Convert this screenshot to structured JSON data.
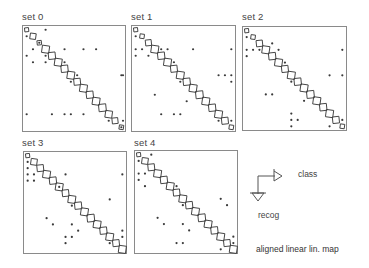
{
  "figure": {
    "caption": "aligned linear lin. map",
    "legend": {
      "x_axis_label": "class",
      "y_axis_label": "recog"
    }
  },
  "chart_data": {
    "type": "heatmap",
    "title": "aligned linear lin. map",
    "xlabel": "class",
    "ylabel": "recog",
    "grid_size": 16,
    "note": "confusion matrices; diagonal entries drawn as squares (size ~ count), off-diagonal errors drawn as dots; positions are [row, col] class indices",
    "panels": [
      {
        "label": "set 0",
        "diagonal_relative_size": [
          0.55,
          0.8,
          0.6,
          1.0,
          0.95,
          1.0,
          0.95,
          1.0,
          0.9,
          1.0,
          0.95,
          1.0,
          1.0,
          0.95,
          0.8,
          0.6
        ],
        "off_diagonal": [
          [
            0,
            3
          ],
          [
            1,
            0
          ],
          [
            2,
            2
          ],
          [
            3,
            1
          ],
          [
            3,
            6
          ],
          [
            3,
            9
          ],
          [
            3,
            11
          ],
          [
            4,
            0
          ],
          [
            4,
            3
          ],
          [
            5,
            1
          ],
          [
            5,
            3
          ],
          [
            5,
            6
          ],
          [
            7,
            8
          ],
          [
            7,
            15
          ],
          [
            7,
            16
          ],
          [
            8,
            7
          ],
          [
            13,
            0
          ],
          [
            13,
            4
          ],
          [
            13,
            6
          ],
          [
            13,
            7
          ],
          [
            13,
            9
          ],
          [
            14,
            13
          ],
          [
            14,
            16
          ],
          [
            15,
            15
          ]
        ]
      },
      {
        "label": "set 1",
        "diagonal_relative_size": [
          0.55,
          0.6,
          0.8,
          1.0,
          0.95,
          1.0,
          0.9,
          1.0,
          0.95,
          1.0,
          1.0,
          1.0,
          0.95,
          1.0,
          0.9,
          0.6
        ],
        "off_diagonal": [
          [
            1,
            0
          ],
          [
            3,
            0
          ],
          [
            3,
            1
          ],
          [
            3,
            4
          ],
          [
            3,
            5
          ],
          [
            3,
            9
          ],
          [
            3,
            15
          ],
          [
            4,
            0
          ],
          [
            4,
            2
          ],
          [
            5,
            6
          ],
          [
            7,
            13
          ],
          [
            7,
            14
          ],
          [
            7,
            15
          ],
          [
            8,
            7
          ],
          [
            8,
            15
          ],
          [
            10,
            3
          ],
          [
            11,
            8
          ],
          [
            13,
            4
          ],
          [
            13,
            6
          ],
          [
            13,
            7
          ],
          [
            14,
            15
          ],
          [
            14,
            13
          ]
        ]
      },
      {
        "label": "set 2",
        "diagonal_relative_size": [
          0.55,
          0.6,
          0.85,
          1.0,
          0.95,
          1.0,
          0.9,
          1.0,
          0.95,
          1.0,
          1.0,
          1.0,
          0.95,
          1.0,
          0.9,
          0.6
        ],
        "off_diagonal": [
          [
            1,
            0
          ],
          [
            2,
            4
          ],
          [
            3,
            0
          ],
          [
            3,
            1
          ],
          [
            3,
            2
          ],
          [
            3,
            5
          ],
          [
            3,
            15
          ],
          [
            4,
            0
          ],
          [
            5,
            6
          ],
          [
            7,
            13
          ],
          [
            7,
            15
          ],
          [
            8,
            7
          ],
          [
            10,
            3
          ],
          [
            10,
            4
          ],
          [
            11,
            9
          ],
          [
            13,
            7
          ],
          [
            14,
            7
          ],
          [
            14,
            8
          ],
          [
            14,
            15
          ],
          [
            15,
            7
          ],
          [
            15,
            13
          ]
        ]
      },
      {
        "label": "set 3",
        "diagonal_relative_size": [
          0.55,
          0.85,
          0.9,
          1.0,
          0.95,
          1.0,
          0.9,
          1.0,
          0.95,
          1.0,
          1.0,
          1.0,
          0.95,
          1.0,
          0.9,
          1.0
        ],
        "off_diagonal": [
          [
            1,
            0
          ],
          [
            2,
            0
          ],
          [
            3,
            0
          ],
          [
            3,
            1
          ],
          [
            3,
            6
          ],
          [
            3,
            15
          ],
          [
            4,
            0
          ],
          [
            4,
            1
          ],
          [
            5,
            5
          ],
          [
            7,
            13
          ],
          [
            8,
            7
          ],
          [
            10,
            3
          ],
          [
            11,
            4
          ],
          [
            11,
            7
          ],
          [
            12,
            8
          ],
          [
            13,
            6
          ],
          [
            13,
            7
          ],
          [
            14,
            6
          ],
          [
            14,
            13
          ],
          [
            12,
            15
          ],
          [
            13,
            15
          ]
        ]
      },
      {
        "label": "set 4",
        "diagonal_relative_size": [
          0.55,
          0.85,
          0.9,
          1.0,
          0.95,
          1.0,
          0.9,
          1.0,
          0.95,
          1.0,
          1.0,
          1.0,
          0.95,
          1.0,
          0.9,
          1.0
        ],
        "off_diagonal": [
          [
            0,
            2
          ],
          [
            1,
            0
          ],
          [
            3,
            0
          ],
          [
            3,
            1
          ],
          [
            4,
            0
          ],
          [
            5,
            1
          ],
          [
            5,
            6
          ],
          [
            7,
            13
          ],
          [
            8,
            7
          ],
          [
            8,
            14
          ],
          [
            10,
            3
          ],
          [
            11,
            7
          ],
          [
            11,
            4
          ],
          [
            12,
            8
          ],
          [
            14,
            6
          ],
          [
            14,
            7
          ],
          [
            14,
            15
          ],
          [
            15,
            13
          ],
          [
            13,
            15
          ]
        ]
      }
    ]
  }
}
